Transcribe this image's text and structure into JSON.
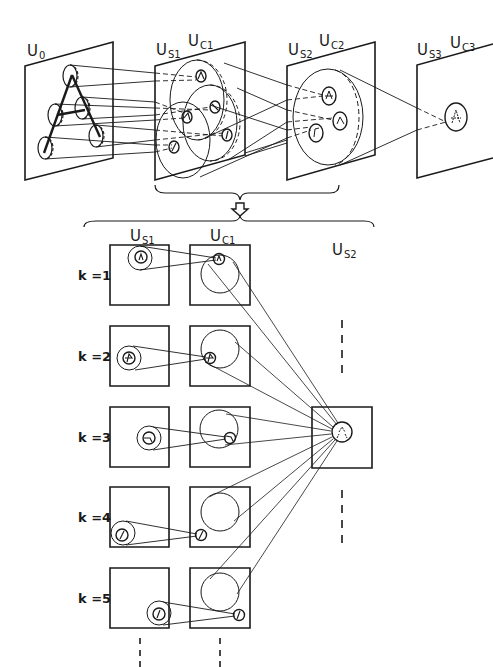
{
  "figure": {
    "top_view": {
      "layers": [
        {
          "id": "U0",
          "label_main": "U",
          "label_sub": "0"
        },
        {
          "id": "US1-UC1",
          "labels": [
            {
              "main": "U",
              "sub": "S1"
            },
            {
              "main": "U",
              "sub": "C1"
            }
          ]
        },
        {
          "id": "US2-UC2",
          "labels": [
            {
              "main": "U",
              "sub": "S2"
            },
            {
              "main": "U",
              "sub": "C2"
            }
          ]
        },
        {
          "id": "US3-UC3",
          "labels": [
            {
              "main": "U",
              "sub": "S3"
            },
            {
              "main": "U",
              "sub": "C3"
            }
          ]
        }
      ],
      "input_pattern": "A",
      "arrow_symbol": "⇩"
    },
    "bottom_view": {
      "column_headers": [
        {
          "main": "U",
          "sub": "S1"
        },
        {
          "main": "U",
          "sub": "C1"
        },
        {
          "main": "U",
          "sub": "S2"
        }
      ],
      "rows": [
        {
          "label": "k =1"
        },
        {
          "label": "k =2"
        },
        {
          "label": "k =3"
        },
        {
          "label": "k =4"
        },
        {
          "label": "k =5"
        }
      ]
    },
    "colors": {
      "ink": "#1a1a1a",
      "background": "#ffffff"
    }
  }
}
